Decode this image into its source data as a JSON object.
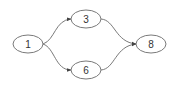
{
  "diagram": {
    "type": "directed-graph",
    "nodes": [
      {
        "id": "n1",
        "label": "1",
        "cx": 28,
        "cy": 44
      },
      {
        "id": "n3",
        "label": "3",
        "cx": 86,
        "cy": 19
      },
      {
        "id": "n6",
        "label": "6",
        "cx": 86,
        "cy": 70
      },
      {
        "id": "n8",
        "label": "8",
        "cx": 151,
        "cy": 44
      }
    ],
    "edges": [
      {
        "from": "1",
        "to": "3"
      },
      {
        "from": "1",
        "to": "6"
      },
      {
        "from": "3",
        "to": "8"
      },
      {
        "from": "6",
        "to": "8"
      }
    ],
    "colors": {
      "node_stroke": "#7a7a7a",
      "edge": "#6a6a6a",
      "text": "#333333",
      "background": "#ffffff"
    }
  }
}
